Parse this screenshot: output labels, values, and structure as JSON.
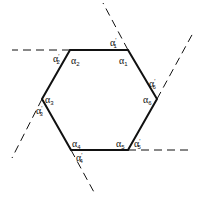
{
  "diagram": {
    "colors": {
      "line": "#111111",
      "background": "#ffffff"
    },
    "interior_angles": [
      {
        "id": "a1",
        "symbol": "α",
        "sub": "1",
        "prime": ""
      },
      {
        "id": "a2",
        "symbol": "α",
        "sub": "2",
        "prime": ""
      },
      {
        "id": "a3",
        "symbol": "α",
        "sub": "3",
        "prime": ""
      },
      {
        "id": "a4",
        "symbol": "α",
        "sub": "4",
        "prime": ""
      },
      {
        "id": "a5",
        "symbol": "α",
        "sub": "5",
        "prime": ""
      },
      {
        "id": "a6",
        "symbol": "α",
        "sub": "6",
        "prime": ""
      }
    ],
    "exterior_angles": [
      {
        "id": "a1p",
        "symbol": "α",
        "sub": "1",
        "prime": "′"
      },
      {
        "id": "a2p",
        "symbol": "α",
        "sub": "2",
        "prime": "′"
      },
      {
        "id": "a3p",
        "symbol": "α",
        "sub": "3",
        "prime": "′"
      },
      {
        "id": "a4p",
        "symbol": "α",
        "sub": "4",
        "prime": "′"
      },
      {
        "id": "a5p",
        "symbol": "α",
        "sub": "5",
        "prime": "′"
      },
      {
        "id": "a6p",
        "symbol": "α",
        "sub": "6",
        "prime": "′"
      }
    ]
  }
}
